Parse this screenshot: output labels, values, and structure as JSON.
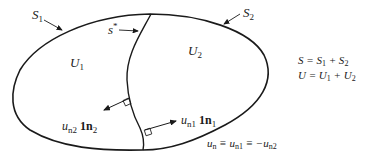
{
  "labels": {
    "surface1": {
      "main": "S",
      "sub": "1"
    },
    "surface2": {
      "main": "S",
      "sub": "2"
    },
    "interface": {
      "main": "s",
      "sup": "*"
    },
    "region1": {
      "main": "U",
      "sub": "1"
    },
    "region2": {
      "main": "U",
      "sub": "2"
    },
    "normal2": {
      "main": "u",
      "sub": "n2",
      "vec": "1",
      "vec_n": "n",
      "vec_sub": "2"
    },
    "normal1": {
      "main": "u",
      "sub": "n1",
      "vec": "1",
      "vec_n": "n",
      "vec_sub": "1"
    }
  },
  "equations": {
    "surface_sum": {
      "lhs": "S = S",
      "s1": "1",
      "plus": " + S",
      "s2": "2"
    },
    "region_sum": {
      "lhs": "U = U",
      "u1": "1",
      "plus": " + U",
      "u2": "2"
    },
    "continuity": {
      "a": "u",
      "a_sub": "n",
      "eq1": " ≡ u",
      "b_sub": "n1",
      "eq2": " ≡ −u",
      "c_sub": "n2"
    }
  },
  "colors": {
    "stroke": "#1a1a1a",
    "background": "#ffffff"
  }
}
